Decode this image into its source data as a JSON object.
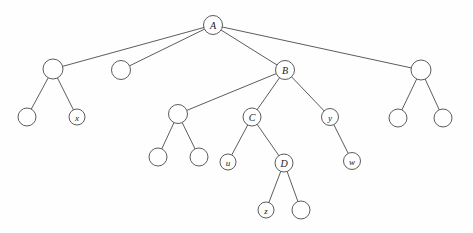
{
  "figure": {
    "type": "tree-diagram",
    "title": "",
    "background_color": "#fefefe",
    "stroke_color": "#4a4a4a",
    "label_color": "#1a1a1a"
  },
  "nodes": [
    {
      "id": "A",
      "label": "A",
      "cx": 213,
      "cy": 25,
      "r": 9.5,
      "labeled": true
    },
    {
      "id": "n1",
      "label": "",
      "cx": 53,
      "cy": 69,
      "r": 10.0,
      "labeled": false
    },
    {
      "id": "n2",
      "label": "",
      "cx": 121,
      "cy": 70,
      "r": 9.5,
      "labeled": false
    },
    {
      "id": "B",
      "label": "B",
      "cx": 285,
      "cy": 70,
      "r": 9.5,
      "labeled": true
    },
    {
      "id": "n3",
      "label": "",
      "cx": 421,
      "cy": 70,
      "r": 10.0,
      "labeled": false
    },
    {
      "id": "n4",
      "label": "",
      "cx": 27,
      "cy": 117,
      "r": 9.0,
      "labeled": false
    },
    {
      "id": "x",
      "label": "x",
      "cx": 77,
      "cy": 117,
      "r": 8.0,
      "labeled": true
    },
    {
      "id": "n5",
      "label": "",
      "cx": 178,
      "cy": 114,
      "r": 9.5,
      "labeled": false
    },
    {
      "id": "C",
      "label": "C",
      "cx": 252,
      "cy": 117,
      "r": 9.0,
      "labeled": true
    },
    {
      "id": "y",
      "label": "y",
      "cx": 330,
      "cy": 117,
      "r": 8.5,
      "labeled": true
    },
    {
      "id": "n6",
      "label": "",
      "cx": 398,
      "cy": 118,
      "r": 9.0,
      "labeled": false
    },
    {
      "id": "n7",
      "label": "",
      "cx": 443,
      "cy": 118,
      "r": 9.0,
      "labeled": false
    },
    {
      "id": "n8",
      "label": "",
      "cx": 158,
      "cy": 157,
      "r": 9.0,
      "labeled": false
    },
    {
      "id": "n9",
      "label": "",
      "cx": 199,
      "cy": 157,
      "r": 9.0,
      "labeled": false
    },
    {
      "id": "u",
      "label": "u",
      "cx": 228,
      "cy": 162,
      "r": 8.0,
      "labeled": true
    },
    {
      "id": "D",
      "label": "D",
      "cx": 284,
      "cy": 163,
      "r": 9.0,
      "labeled": true
    },
    {
      "id": "w",
      "label": "w",
      "cx": 352,
      "cy": 161,
      "r": 8.5,
      "labeled": true
    },
    {
      "id": "z",
      "label": "z",
      "cx": 266,
      "cy": 210,
      "r": 8.0,
      "labeled": true
    },
    {
      "id": "n10",
      "label": "",
      "cx": 301,
      "cy": 210,
      "r": 9.0,
      "labeled": false
    }
  ],
  "edges": [
    {
      "from": "A",
      "to": "n1"
    },
    {
      "from": "A",
      "to": "n2"
    },
    {
      "from": "A",
      "to": "B"
    },
    {
      "from": "A",
      "to": "n3"
    },
    {
      "from": "n1",
      "to": "n4"
    },
    {
      "from": "n1",
      "to": "x"
    },
    {
      "from": "B",
      "to": "n5"
    },
    {
      "from": "B",
      "to": "C"
    },
    {
      "from": "B",
      "to": "y"
    },
    {
      "from": "n3",
      "to": "n6"
    },
    {
      "from": "n3",
      "to": "n7"
    },
    {
      "from": "n5",
      "to": "n8"
    },
    {
      "from": "n5",
      "to": "n9"
    },
    {
      "from": "C",
      "to": "u"
    },
    {
      "from": "C",
      "to": "D"
    },
    {
      "from": "y",
      "to": "w"
    },
    {
      "from": "D",
      "to": "z"
    },
    {
      "from": "D",
      "to": "n10"
    }
  ]
}
